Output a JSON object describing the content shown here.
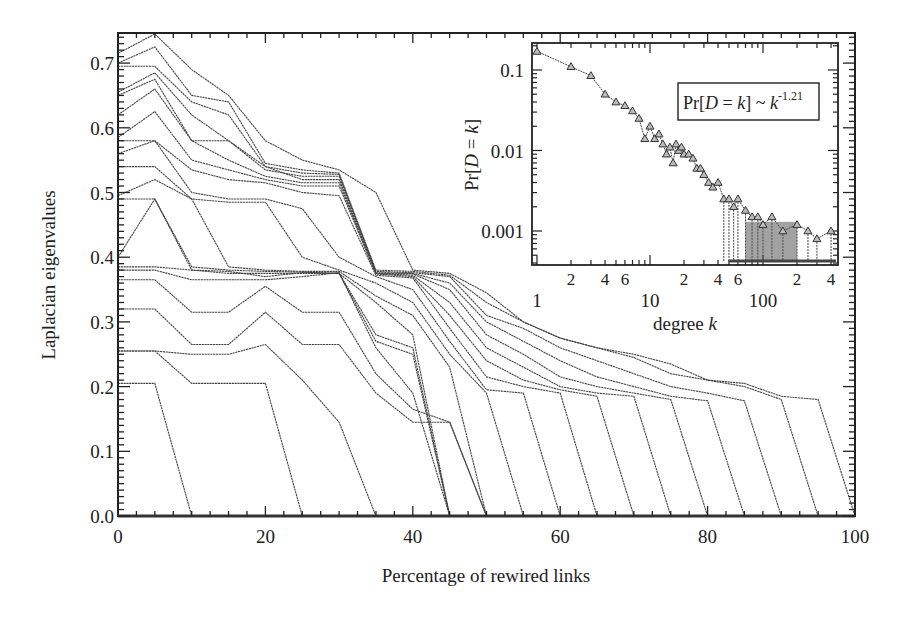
{
  "chart_data": [
    {
      "type": "line",
      "title": "",
      "xlabel": "Percentage of rewired links",
      "ylabel": "Laplacian eigenvalues",
      "xlim": [
        0,
        100
      ],
      "ylim": [
        0.0,
        0.745
      ],
      "xticks": [
        0,
        20,
        40,
        60,
        80,
        100
      ],
      "xtick_labels": [
        "0",
        "20",
        "40",
        "60",
        "80",
        "100"
      ],
      "yticks": [
        0.0,
        0.1,
        0.2,
        0.3,
        0.4,
        0.5,
        0.6,
        0.7
      ],
      "ytick_labels": [
        "0.0",
        "0.1",
        "0.2",
        "0.3",
        "0.4",
        "0.5",
        "0.6",
        "0.7"
      ],
      "grid": false,
      "legend": null,
      "line_color": "#444444",
      "x": [
        0,
        5,
        10,
        15,
        20,
        25,
        30,
        35,
        40,
        45,
        50,
        55,
        60,
        65,
        70,
        75,
        80,
        85,
        90,
        95,
        100
      ],
      "series": [
        {
          "name": "eig-1",
          "values": [
            0.715,
            0.745,
            0.69,
            0.65,
            0.58,
            0.55,
            0.535,
            0.5,
            0.38,
            0.375,
            0.345,
            0.3,
            0.275,
            0.26,
            0.25,
            0.235,
            0.21,
            0.205,
            0.185,
            0.18,
            0.0
          ]
        },
        {
          "name": "eig-2",
          "values": [
            0.7,
            0.725,
            0.65,
            0.64,
            0.545,
            0.535,
            0.53,
            0.38,
            0.378,
            0.372,
            0.33,
            0.3,
            0.275,
            0.26,
            0.245,
            0.22,
            0.21,
            0.2,
            0.18,
            0.0,
            null
          ]
        },
        {
          "name": "eig-3",
          "values": [
            0.695,
            0.695,
            0.64,
            0.62,
            0.54,
            0.53,
            0.528,
            0.378,
            0.376,
            0.37,
            0.31,
            0.29,
            0.26,
            0.24,
            0.22,
            0.2,
            0.19,
            0.178,
            0.0,
            null,
            null
          ]
        },
        {
          "name": "eig-4",
          "values": [
            0.655,
            0.685,
            0.62,
            0.58,
            0.535,
            0.525,
            0.525,
            0.376,
            0.375,
            0.36,
            0.3,
            0.27,
            0.24,
            0.215,
            0.2,
            0.185,
            0.178,
            0.0,
            null,
            null,
            null
          ]
        },
        {
          "name": "eig-5",
          "values": [
            0.65,
            0.675,
            0.58,
            0.58,
            0.54,
            0.52,
            0.52,
            0.375,
            0.374,
            0.35,
            0.28,
            0.25,
            0.215,
            0.2,
            0.19,
            0.18,
            0.0,
            null,
            null,
            null,
            null
          ]
        },
        {
          "name": "eig-6",
          "values": [
            0.62,
            0.66,
            0.58,
            0.55,
            0.525,
            0.515,
            0.515,
            0.375,
            0.372,
            0.33,
            0.26,
            0.23,
            0.2,
            0.19,
            0.185,
            0.0,
            null,
            null,
            null,
            null,
            null
          ]
        },
        {
          "name": "eig-7",
          "values": [
            0.585,
            0.625,
            0.55,
            0.535,
            0.52,
            0.51,
            0.51,
            0.374,
            0.37,
            0.31,
            0.24,
            0.21,
            0.195,
            0.185,
            0.0,
            null,
            null,
            null,
            null,
            null,
            null
          ]
        },
        {
          "name": "eig-8",
          "values": [
            0.58,
            0.58,
            0.535,
            0.52,
            0.515,
            0.5,
            0.495,
            0.372,
            0.368,
            0.29,
            0.215,
            0.2,
            0.19,
            0.0,
            null,
            null,
            null,
            null,
            null,
            null,
            null
          ]
        },
        {
          "name": "eig-9",
          "values": [
            0.56,
            0.58,
            0.5,
            0.49,
            0.49,
            0.475,
            0.4,
            0.37,
            0.35,
            0.27,
            0.195,
            0.19,
            0.0,
            null,
            null,
            null,
            null,
            null,
            null,
            null,
            null
          ]
        },
        {
          "name": "eig-10",
          "values": [
            0.54,
            0.54,
            0.49,
            0.485,
            0.485,
            0.4,
            0.38,
            0.36,
            0.33,
            0.25,
            0.19,
            0.0,
            null,
            null,
            null,
            null,
            null,
            null,
            null,
            null,
            null
          ]
        },
        {
          "name": "eig-11",
          "values": [
            0.495,
            0.52,
            0.49,
            0.385,
            0.38,
            0.378,
            0.378,
            0.34,
            0.31,
            0.23,
            0.0,
            null,
            null,
            null,
            null,
            null,
            null,
            null,
            null,
            null,
            null
          ]
        },
        {
          "name": "eig-12",
          "values": [
            0.49,
            0.49,
            0.385,
            0.38,
            0.378,
            0.377,
            0.375,
            0.33,
            0.28,
            0.0,
            null,
            null,
            null,
            null,
            null,
            null,
            null,
            null,
            null,
            null,
            null
          ]
        },
        {
          "name": "eig-13",
          "values": [
            0.4,
            0.49,
            0.38,
            0.378,
            0.37,
            0.376,
            0.375,
            0.28,
            0.26,
            0.0,
            null,
            null,
            null,
            null,
            null,
            null,
            null,
            null,
            null,
            null,
            null
          ]
        },
        {
          "name": "eig-14",
          "values": [
            0.385,
            0.385,
            0.38,
            0.375,
            0.375,
            0.375,
            0.375,
            0.27,
            0.25,
            0.0,
            null,
            null,
            null,
            null,
            null,
            null,
            null,
            null,
            null,
            null,
            null
          ]
        },
        {
          "name": "eig-15",
          "values": [
            0.38,
            0.38,
            0.365,
            0.365,
            0.365,
            0.37,
            0.376,
            0.26,
            0.19,
            0.0,
            null,
            null,
            null,
            null,
            null,
            null,
            null,
            null,
            null,
            null,
            null
          ]
        },
        {
          "name": "eig-16",
          "values": [
            0.365,
            0.365,
            0.315,
            0.315,
            0.355,
            0.315,
            0.315,
            0.22,
            0.165,
            0.145,
            0.0,
            null,
            null,
            null,
            null,
            null,
            null,
            null,
            null,
            null,
            null
          ]
        },
        {
          "name": "eig-17",
          "values": [
            0.32,
            0.32,
            0.265,
            0.265,
            0.315,
            0.265,
            0.265,
            0.19,
            0.145,
            0.145,
            0.0,
            null,
            null,
            null,
            null,
            null,
            null,
            null,
            null,
            null,
            null
          ]
        },
        {
          "name": "eig-18",
          "values": [
            0.255,
            0.255,
            0.25,
            0.25,
            0.265,
            0.21,
            0.145,
            0.0,
            null,
            null,
            null,
            null,
            null,
            null,
            null,
            null,
            null,
            null,
            null,
            null,
            null
          ]
        },
        {
          "name": "eig-19",
          "values": [
            0.255,
            0.255,
            0.205,
            0.205,
            0.205,
            0.0,
            null,
            null,
            null,
            null,
            null,
            null,
            null,
            null,
            null,
            null,
            null,
            null,
            null,
            null,
            null
          ]
        },
        {
          "name": "eig-20",
          "values": [
            0.205,
            0.205,
            0.0,
            null,
            null,
            null,
            null,
            null,
            null,
            null,
            null,
            null,
            null,
            null,
            null,
            null,
            null,
            null,
            null,
            null,
            null
          ]
        }
      ]
    },
    {
      "type": "scatter",
      "title": "",
      "xlabel": "degree k",
      "ylabel": "Pr[D = k]",
      "xscale": "log",
      "yscale": "log",
      "xlim": [
        1,
        460
      ],
      "ylim": [
        0.00038,
        0.22
      ],
      "xticks_major": [
        1,
        10,
        100
      ],
      "xtick_labels_major": [
        "1",
        "10",
        "100"
      ],
      "xtick_labels_minor": [
        "2",
        "4",
        "6",
        "2",
        "4",
        "6",
        "2",
        "4"
      ],
      "yticks": [
        0.1,
        0.01,
        0.001
      ],
      "ytick_labels": [
        "0.1",
        "0.01",
        "0.001"
      ],
      "annotation": "Pr[D = k] ~ k^-1.21",
      "annotation_text": {
        "prefix": "Pr[",
        "var_d": "D",
        "eq": " = ",
        "var_k": "k",
        "suffix": "] ~ ",
        "base": "k",
        "exponent": "-1.21"
      },
      "marker": "triangle",
      "fit_exponent": -1.21,
      "x": [
        1,
        2,
        3,
        4,
        5,
        6,
        7,
        8,
        9,
        10,
        11,
        12,
        13,
        14,
        15,
        16,
        17,
        18,
        19,
        20,
        22,
        24,
        26,
        28,
        30,
        33,
        36,
        40,
        45,
        50,
        55,
        60,
        70,
        80,
        90,
        100,
        120,
        150,
        200,
        250,
        300,
        400
      ],
      "values": [
        0.17,
        0.11,
        0.085,
        0.05,
        0.04,
        0.036,
        0.031,
        0.025,
        0.014,
        0.02,
        0.014,
        0.016,
        0.012,
        0.009,
        0.011,
        0.007,
        0.012,
        0.01,
        0.011,
        0.009,
        0.009,
        0.008,
        0.006,
        0.006,
        0.005,
        0.004,
        0.0035,
        0.004,
        0.0025,
        0.0025,
        0.002,
        0.0025,
        0.0018,
        0.0015,
        0.0015,
        0.0012,
        0.0015,
        0.001,
        0.0012,
        0.001,
        0.0008,
        0.001
      ]
    }
  ],
  "main_axes": {
    "xlabel": "Percentage of rewired links",
    "ylabel": "Laplacian eigenvalues"
  },
  "inset_axes": {
    "xlabel_prefix": "degree ",
    "xlabel_var": "k",
    "ylabel_prefix": "Pr[",
    "ylabel_var_d": "D",
    "ylabel_eq": " = ",
    "ylabel_var_k": "k",
    "ylabel_suffix": "]"
  }
}
